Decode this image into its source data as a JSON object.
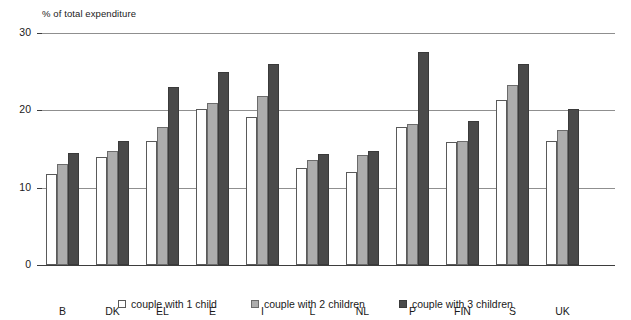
{
  "chart_data": {
    "type": "bar",
    "title": "",
    "subtitle": "",
    "xlabel": "",
    "ylabel": "% of total expenditure",
    "ylim": [
      0,
      30
    ],
    "yticks": [
      0,
      10,
      20,
      30
    ],
    "ytick_labels": [
      "0",
      "10",
      "20",
      "30"
    ],
    "grid": true,
    "legend_position": "bottom",
    "categories": [
      "B",
      "DK",
      "EL",
      "E",
      "I",
      "L",
      "NL",
      "P",
      "FIN",
      "S",
      "UK"
    ],
    "series": [
      {
        "name": "couple with 1 child",
        "color": "#ffffff",
        "values": [
          11.8,
          14.0,
          16.0,
          20.2,
          19.2,
          12.5,
          12.0,
          17.8,
          15.9,
          21.4,
          16.1
        ]
      },
      {
        "name": "couple with 2 children",
        "color": "#adadad",
        "values": [
          13.1,
          14.8,
          17.8,
          21.0,
          21.9,
          13.6,
          14.2,
          18.2,
          16.1,
          23.3,
          17.5
        ]
      },
      {
        "name": "couple with 3 children",
        "color": "#4a4a4a",
        "values": [
          14.5,
          16.0,
          23.0,
          25.0,
          26.0,
          14.4,
          14.7,
          27.6,
          18.6,
          26.0,
          20.2
        ]
      }
    ]
  },
  "colors": {
    "series_1_child": "#ffffff",
    "series_2_children": "#adadad",
    "series_3_children": "#4a4a4a",
    "gridline": "#8f8f8f",
    "axis": "#3d3d3d",
    "text": "#1a1a1a",
    "background": "#ffffff"
  }
}
